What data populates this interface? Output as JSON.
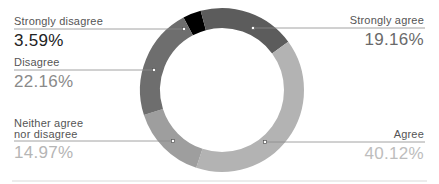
{
  "chart_data": {
    "type": "pie",
    "variant": "donut",
    "title": "",
    "categories": [
      "Strongly disagree",
      "Strongly agree",
      "Agree",
      "Neither agree nor disagree",
      "Disagree"
    ],
    "values": [
      3.59,
      19.16,
      40.12,
      14.97,
      22.16
    ],
    "value_labels": [
      "3.59%",
      "19.16%",
      "40.12%",
      "14.97%",
      "22.16%"
    ],
    "colors": [
      "#000000",
      "#5c5c5c",
      "#b3b3b3",
      "#9e9e9e",
      "#6e6e6e"
    ],
    "legend": "callout labels with leader lines",
    "grid": false
  },
  "labels": {
    "strongly_disagree": {
      "name": "Strongly disagree",
      "value": "3.59%"
    },
    "disagree": {
      "name": "Disagree",
      "value": "22.16%"
    },
    "neither_line1": "Neither agree",
    "neither_line2": "nor disagree",
    "neither_value": "14.97%",
    "strongly_agree": {
      "name": "Strongly agree",
      "value": "19.16%"
    },
    "agree": {
      "name": "Agree",
      "value": "40.12%"
    }
  }
}
